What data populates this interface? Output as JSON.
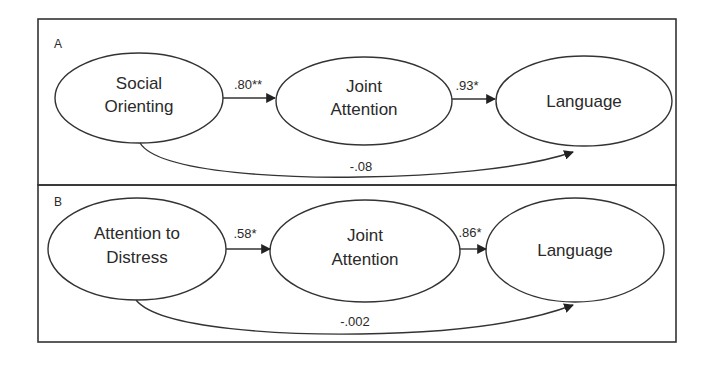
{
  "panels": [
    {
      "label": "A",
      "nodes": [
        {
          "id": "social-orienting",
          "lines": [
            "Social",
            "Orienting"
          ]
        },
        {
          "id": "joint-attention",
          "lines": [
            "Joint",
            "Attention"
          ]
        },
        {
          "id": "language",
          "lines": [
            "Language"
          ]
        }
      ],
      "edges": [
        {
          "from": "social-orienting",
          "to": "joint-attention",
          "label": ".80**"
        },
        {
          "from": "joint-attention",
          "to": "language",
          "label": ".93*"
        },
        {
          "from": "social-orienting",
          "to": "language",
          "label": "-.08"
        }
      ]
    },
    {
      "label": "B",
      "nodes": [
        {
          "id": "attention-to-distress",
          "lines": [
            "Attention to",
            "Distress"
          ]
        },
        {
          "id": "joint-attention",
          "lines": [
            "Joint",
            "Attention"
          ]
        },
        {
          "id": "language",
          "lines": [
            "Language"
          ]
        }
      ],
      "edges": [
        {
          "from": "attention-to-distress",
          "to": "joint-attention",
          "label": ".58*"
        },
        {
          "from": "joint-attention",
          "to": "language",
          "label": ".86*"
        },
        {
          "from": "attention-to-distress",
          "to": "language",
          "label": "-.002"
        }
      ]
    }
  ]
}
